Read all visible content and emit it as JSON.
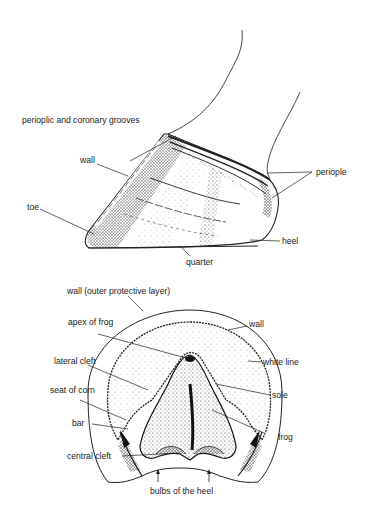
{
  "side_view": {
    "labels": {
      "grooves": "perioplic and coronary grooves",
      "wall": "wall",
      "toe": "toe",
      "periople": "periople",
      "heel": "heel",
      "quarter": "quarter"
    }
  },
  "sole_view": {
    "labels": {
      "outer_wall": "wall (outer protective layer)",
      "apex": "apex of frog",
      "wall": "wall",
      "white_line": "white line",
      "lateral_cleft": "lateral cleft",
      "sole": "sole",
      "seat_of_corn": "seat of corn",
      "bar": "bar",
      "frog": "frog",
      "central_cleft": "central cleft",
      "bulbs": "bulbs of the heel"
    }
  },
  "colors": {
    "ink": "#222222",
    "background": "#ffffff"
  }
}
